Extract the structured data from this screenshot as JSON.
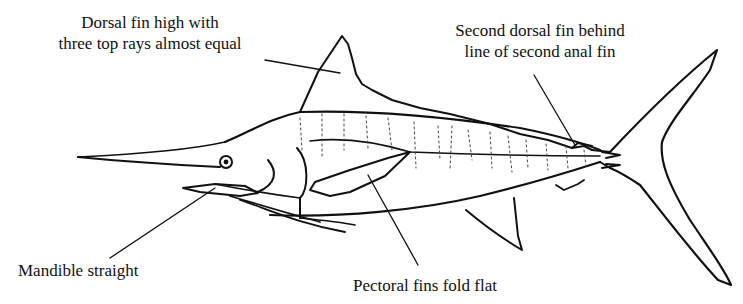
{
  "figure": {
    "labels": [
      {
        "id": "dorsal",
        "lines": [
          "Dorsal fin high with",
          "three top rays almost equal"
        ]
      },
      {
        "id": "second",
        "lines": [
          "Second dorsal fin behind",
          "line of second anal fin"
        ]
      },
      {
        "id": "mandible",
        "lines": [
          "Mandible straight"
        ]
      },
      {
        "id": "pectoral",
        "lines": [
          "Pectoral fins fold flat"
        ]
      }
    ],
    "colors": {
      "ink": "#111111",
      "background": "#ffffff"
    }
  }
}
